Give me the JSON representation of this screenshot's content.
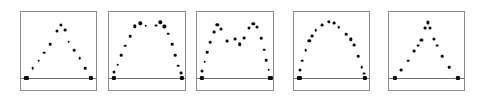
{
  "figure": {
    "title": "",
    "width": 480,
    "height": 104,
    "background": "#ffffff",
    "panel_count": 5,
    "marker_color": "#0a0a0a",
    "frame_color": "#8c8c8c",
    "baseline_color": "#6e6e6e"
  },
  "chart_data": {
    "type": "scatter",
    "title": "",
    "subtitle": "",
    "xlabel": "",
    "ylabel": "",
    "grid": false,
    "legend": null,
    "axis_ranges": {
      "xlim": [
        0,
        100
      ],
      "ylim": [
        0,
        100
      ]
    },
    "panels": [
      {
        "index": 1,
        "name": "panel-triangular-peak",
        "shape_label": "triangular peak",
        "frame": {
          "x": 20,
          "y": 11,
          "w": 77,
          "h": 80
        },
        "baseline_y": 82,
        "points": [
          {
            "x": 7,
            "y": 82,
            "size": 4.2,
            "marker": "square"
          },
          {
            "x": 15,
            "y": 70,
            "size": 2.6,
            "marker": "circle"
          },
          {
            "x": 23,
            "y": 61,
            "size": 2.6,
            "marker": "circle"
          },
          {
            "x": 30,
            "y": 51,
            "size": 2.6,
            "marker": "circle"
          },
          {
            "x": 38,
            "y": 40,
            "size": 2.6,
            "marker": "circle"
          },
          {
            "x": 47,
            "y": 24,
            "size": 3.0,
            "marker": "circle"
          },
          {
            "x": 52,
            "y": 16,
            "size": 3.2,
            "marker": "circle"
          },
          {
            "x": 57,
            "y": 23,
            "size": 2.8,
            "marker": "circle"
          },
          {
            "x": 62,
            "y": 37,
            "size": 2.6,
            "marker": "circle"
          },
          {
            "x": 69,
            "y": 48,
            "size": 2.6,
            "marker": "circle"
          },
          {
            "x": 76,
            "y": 58,
            "size": 2.6,
            "marker": "circle"
          },
          {
            "x": 83,
            "y": 70,
            "size": 2.6,
            "marker": "circle"
          },
          {
            "x": 91,
            "y": 82,
            "size": 4.2,
            "marker": "square"
          }
        ]
      },
      {
        "index": 2,
        "name": "panel-flat-top-plateau",
        "shape_label": "flat-top plateau",
        "frame": {
          "x": 108,
          "y": 11,
          "w": 78,
          "h": 80
        },
        "baseline_y": 82,
        "points": [
          {
            "x": 6,
            "y": 82,
            "size": 4.2,
            "marker": "square"
          },
          {
            "x": 7,
            "y": 75,
            "size": 3.0,
            "marker": "circle"
          },
          {
            "x": 11,
            "y": 66,
            "size": 2.6,
            "marker": "circle"
          },
          {
            "x": 16,
            "y": 54,
            "size": 2.6,
            "marker": "circle"
          },
          {
            "x": 21,
            "y": 42,
            "size": 2.6,
            "marker": "circle"
          },
          {
            "x": 27,
            "y": 30,
            "size": 2.6,
            "marker": "circle"
          },
          {
            "x": 33,
            "y": 18,
            "size": 3.4,
            "marker": "circle"
          },
          {
            "x": 40,
            "y": 14,
            "size": 3.4,
            "marker": "circle"
          },
          {
            "x": 47,
            "y": 17,
            "size": 2.6,
            "marker": "circle"
          },
          {
            "x": 60,
            "y": 17,
            "size": 2.8,
            "marker": "circle"
          },
          {
            "x": 66,
            "y": 13,
            "size": 3.4,
            "marker": "circle"
          },
          {
            "x": 71,
            "y": 18,
            "size": 3.2,
            "marker": "circle"
          },
          {
            "x": 76,
            "y": 27,
            "size": 2.6,
            "marker": "circle"
          },
          {
            "x": 81,
            "y": 40,
            "size": 2.6,
            "marker": "circle"
          },
          {
            "x": 85,
            "y": 54,
            "size": 2.6,
            "marker": "circle"
          },
          {
            "x": 89,
            "y": 67,
            "size": 2.6,
            "marker": "circle"
          },
          {
            "x": 92,
            "y": 76,
            "size": 2.8,
            "marker": "circle"
          },
          {
            "x": 93,
            "y": 82,
            "size": 4.2,
            "marker": "square"
          }
        ]
      },
      {
        "index": 3,
        "name": "panel-bimodal-dip",
        "shape_label": "bimodal with central dip",
        "frame": {
          "x": 196,
          "y": 11,
          "w": 78,
          "h": 80
        },
        "baseline_y": 82,
        "points": [
          {
            "x": 6,
            "y": 82,
            "size": 4.2,
            "marker": "square"
          },
          {
            "x": 7,
            "y": 74,
            "size": 3.0,
            "marker": "circle"
          },
          {
            "x": 10,
            "y": 62,
            "size": 2.6,
            "marker": "circle"
          },
          {
            "x": 13,
            "y": 50,
            "size": 2.6,
            "marker": "circle"
          },
          {
            "x": 17,
            "y": 38,
            "size": 2.6,
            "marker": "circle"
          },
          {
            "x": 22,
            "y": 25,
            "size": 2.8,
            "marker": "circle"
          },
          {
            "x": 26,
            "y": 16,
            "size": 3.4,
            "marker": "circle"
          },
          {
            "x": 31,
            "y": 21,
            "size": 3.0,
            "marker": "circle"
          },
          {
            "x": 39,
            "y": 36,
            "size": 2.8,
            "marker": "circle"
          },
          {
            "x": 49,
            "y": 34,
            "size": 2.8,
            "marker": "circle"
          },
          {
            "x": 55,
            "y": 40,
            "size": 3.6,
            "marker": "circle"
          },
          {
            "x": 60,
            "y": 33,
            "size": 2.8,
            "marker": "circle"
          },
          {
            "x": 67,
            "y": 20,
            "size": 3.0,
            "marker": "circle"
          },
          {
            "x": 72,
            "y": 15,
            "size": 3.4,
            "marker": "circle"
          },
          {
            "x": 77,
            "y": 19,
            "size": 3.0,
            "marker": "circle"
          },
          {
            "x": 82,
            "y": 33,
            "size": 2.6,
            "marker": "circle"
          },
          {
            "x": 86,
            "y": 47,
            "size": 2.6,
            "marker": "circle"
          },
          {
            "x": 89,
            "y": 60,
            "size": 2.6,
            "marker": "circle"
          },
          {
            "x": 92,
            "y": 72,
            "size": 2.6,
            "marker": "circle"
          },
          {
            "x": 94,
            "y": 82,
            "size": 4.2,
            "marker": "square"
          }
        ]
      },
      {
        "index": 4,
        "name": "panel-smooth-dome",
        "shape_label": "smooth dome arch",
        "frame": {
          "x": 293,
          "y": 11,
          "w": 77,
          "h": 80
        },
        "baseline_y": 82,
        "points": [
          {
            "x": 7,
            "y": 82,
            "size": 4.2,
            "marker": "square"
          },
          {
            "x": 8,
            "y": 73,
            "size": 3.0,
            "marker": "circle"
          },
          {
            "x": 11,
            "y": 61,
            "size": 2.6,
            "marker": "circle"
          },
          {
            "x": 15,
            "y": 48,
            "size": 2.6,
            "marker": "circle"
          },
          {
            "x": 20,
            "y": 36,
            "size": 3.4,
            "marker": "circle"
          },
          {
            "x": 23,
            "y": 30,
            "size": 2.8,
            "marker": "circle"
          },
          {
            "x": 28,
            "y": 23,
            "size": 2.6,
            "marker": "circle"
          },
          {
            "x": 37,
            "y": 16,
            "size": 2.8,
            "marker": "circle"
          },
          {
            "x": 45,
            "y": 12,
            "size": 3.4,
            "marker": "circle"
          },
          {
            "x": 52,
            "y": 14,
            "size": 2.8,
            "marker": "circle"
          },
          {
            "x": 58,
            "y": 19,
            "size": 2.6,
            "marker": "circle"
          },
          {
            "x": 68,
            "y": 28,
            "size": 2.6,
            "marker": "circle"
          },
          {
            "x": 74,
            "y": 34,
            "size": 3.4,
            "marker": "circle"
          },
          {
            "x": 78,
            "y": 41,
            "size": 2.8,
            "marker": "circle"
          },
          {
            "x": 83,
            "y": 55,
            "size": 2.6,
            "marker": "circle"
          },
          {
            "x": 88,
            "y": 69,
            "size": 2.6,
            "marker": "circle"
          },
          {
            "x": 91,
            "y": 77,
            "size": 2.8,
            "marker": "circle"
          },
          {
            "x": 92,
            "y": 82,
            "size": 4.2,
            "marker": "square"
          }
        ]
      },
      {
        "index": 5,
        "name": "panel-sharp-narrow-peak",
        "shape_label": "sharp narrow peak",
        "frame": {
          "x": 388,
          "y": 11,
          "w": 77,
          "h": 80
        },
        "baseline_y": 82,
        "points": [
          {
            "x": 8,
            "y": 82,
            "size": 4.2,
            "marker": "square"
          },
          {
            "x": 16,
            "y": 73,
            "size": 2.8,
            "marker": "circle"
          },
          {
            "x": 25,
            "y": 61,
            "size": 2.6,
            "marker": "circle"
          },
          {
            "x": 33,
            "y": 49,
            "size": 2.8,
            "marker": "circle"
          },
          {
            "x": 38,
            "y": 42,
            "size": 2.8,
            "marker": "circle"
          },
          {
            "x": 42,
            "y": 35,
            "size": 3.2,
            "marker": "circle"
          },
          {
            "x": 47,
            "y": 20,
            "size": 2.8,
            "marker": "circle"
          },
          {
            "x": 50,
            "y": 13,
            "size": 3.2,
            "marker": "circle"
          },
          {
            "x": 53,
            "y": 20,
            "size": 3.0,
            "marker": "circle"
          },
          {
            "x": 58,
            "y": 34,
            "size": 3.2,
            "marker": "circle"
          },
          {
            "x": 62,
            "y": 42,
            "size": 2.8,
            "marker": "circle"
          },
          {
            "x": 69,
            "y": 55,
            "size": 2.6,
            "marker": "circle"
          },
          {
            "x": 78,
            "y": 69,
            "size": 2.6,
            "marker": "circle"
          },
          {
            "x": 89,
            "y": 82,
            "size": 4.2,
            "marker": "square"
          }
        ]
      }
    ]
  }
}
